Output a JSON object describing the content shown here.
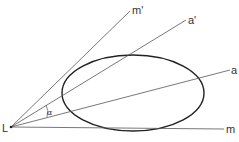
{
  "diagram": {
    "labels": {
      "origin": "L",
      "tangent_upper": "m'",
      "axis_upper": "a'",
      "axis": "a",
      "tangent_lower": "m",
      "angle": "α"
    },
    "colors": {
      "lines": "#555555",
      "ellipse": "#222222",
      "text": "#333333"
    }
  }
}
